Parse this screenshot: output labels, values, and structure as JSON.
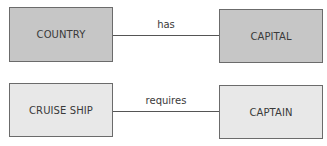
{
  "diagram": {
    "type": "entity-relationship",
    "relationships": [
      {
        "from": {
          "label": "COUNTRY",
          "fill": "#c6c6c6"
        },
        "to": {
          "label": "CAPITAL",
          "fill": "#c6c6c6"
        },
        "label": "has"
      },
      {
        "from": {
          "label": "CRUISE SHIP",
          "fill": "#e8e8e8"
        },
        "to": {
          "label": "CAPTAIN",
          "fill": "#e8e8e8"
        },
        "label": "requires"
      }
    ]
  }
}
